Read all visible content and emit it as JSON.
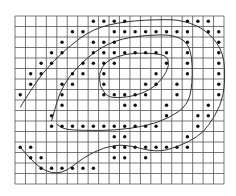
{
  "figure": {
    "grid": {
      "cols": 20,
      "rows": 16,
      "x0": 15,
      "y0": 16,
      "cell_w": 10.45,
      "cell_h": 10.5,
      "line_color": "#555555"
    },
    "dot_color": "#111111",
    "curve_color": "#333333",
    "dots": [
      [
        7,
        0
      ],
      [
        8,
        0
      ],
      [
        9,
        0
      ],
      [
        10,
        0
      ],
      [
        16,
        0
      ],
      [
        17,
        0
      ],
      [
        18,
        0
      ],
      [
        5,
        1
      ],
      [
        6,
        1
      ],
      [
        9,
        1
      ],
      [
        10,
        1
      ],
      [
        11,
        1
      ],
      [
        12,
        1
      ],
      [
        13,
        1
      ],
      [
        14,
        1
      ],
      [
        15,
        1
      ],
      [
        16,
        1
      ],
      [
        18,
        1
      ],
      [
        19,
        1
      ],
      [
        4,
        2
      ],
      [
        7,
        2
      ],
      [
        8,
        2
      ],
      [
        9,
        2
      ],
      [
        16,
        2
      ],
      [
        19,
        2
      ],
      [
        3,
        3
      ],
      [
        4,
        3
      ],
      [
        7,
        3
      ],
      [
        8,
        3
      ],
      [
        9,
        3
      ],
      [
        10,
        3
      ],
      [
        11,
        3
      ],
      [
        12,
        3
      ],
      [
        13,
        3
      ],
      [
        14,
        3
      ],
      [
        16,
        3
      ],
      [
        19,
        3
      ],
      [
        2,
        4
      ],
      [
        3,
        4
      ],
      [
        6,
        4
      ],
      [
        7,
        4
      ],
      [
        8,
        4
      ],
      [
        9,
        4
      ],
      [
        14,
        4
      ],
      [
        16,
        4
      ],
      [
        19,
        4
      ],
      [
        1,
        5
      ],
      [
        2,
        5
      ],
      [
        5,
        5
      ],
      [
        6,
        5
      ],
      [
        8,
        5
      ],
      [
        13,
        5
      ],
      [
        16,
        5
      ],
      [
        19,
        5
      ],
      [
        1,
        6
      ],
      [
        4,
        6
      ],
      [
        5,
        6
      ],
      [
        8,
        6
      ],
      [
        12,
        6
      ],
      [
        13,
        6
      ],
      [
        15,
        6
      ],
      [
        19,
        6
      ],
      [
        0,
        7
      ],
      [
        4,
        7
      ],
      [
        8,
        7
      ],
      [
        9,
        7
      ],
      [
        10,
        7
      ],
      [
        11,
        7
      ],
      [
        12,
        7
      ],
      [
        15,
        7
      ],
      [
        19,
        7
      ],
      [
        4,
        8
      ],
      [
        10,
        8
      ],
      [
        11,
        8
      ],
      [
        14,
        8
      ],
      [
        18,
        8
      ],
      [
        3,
        9
      ],
      [
        14,
        9
      ],
      [
        17,
        9
      ],
      [
        18,
        9
      ],
      [
        3,
        10
      ],
      [
        4,
        10
      ],
      [
        5,
        10
      ],
      [
        6,
        10
      ],
      [
        7,
        10
      ],
      [
        8,
        10
      ],
      [
        9,
        10
      ],
      [
        10,
        10
      ],
      [
        11,
        10
      ],
      [
        12,
        10
      ],
      [
        13,
        10
      ],
      [
        17,
        10
      ],
      [
        9,
        11
      ],
      [
        10,
        11
      ],
      [
        16,
        11
      ],
      [
        0,
        12
      ],
      [
        1,
        12
      ],
      [
        9,
        12
      ],
      [
        10,
        12
      ],
      [
        11,
        12
      ],
      [
        12,
        12
      ],
      [
        13,
        12
      ],
      [
        14,
        12
      ],
      [
        15,
        12
      ],
      [
        16,
        12
      ],
      [
        1,
        13
      ],
      [
        2,
        13
      ],
      [
        9,
        13
      ],
      [
        10,
        13
      ],
      [
        12,
        13
      ],
      [
        2,
        14
      ],
      [
        3,
        14
      ],
      [
        4,
        14
      ],
      [
        5,
        14
      ],
      [
        6,
        14
      ],
      [
        7,
        14
      ]
    ],
    "curves": [
      {
        "name": "outer-curve",
        "points": [
          [
            0,
            8.2
          ],
          [
            2,
            5
          ],
          [
            4.5,
            2.5
          ],
          [
            7,
            0.7
          ],
          [
            10,
            0
          ],
          [
            14,
            -0.2
          ],
          [
            16,
            0
          ],
          [
            18,
            1
          ],
          [
            19.5,
            3
          ],
          [
            19.6,
            6
          ],
          [
            19.2,
            8
          ],
          [
            18,
            10
          ],
          [
            17,
            11
          ],
          [
            15,
            12
          ],
          [
            13,
            12.5
          ],
          [
            10,
            11.7
          ],
          [
            8,
            12
          ],
          [
            6,
            13
          ],
          [
            4,
            14.6
          ],
          [
            2,
            14.2
          ],
          [
            0,
            12
          ]
        ]
      },
      {
        "name": "middle-curve",
        "points": [
          [
            3,
            9.5
          ],
          [
            4,
            6
          ],
          [
            6.5,
            3.3
          ],
          [
            9,
            1.8
          ],
          [
            12,
            1.3
          ],
          [
            15,
            1.3
          ],
          [
            16.4,
            2.5
          ],
          [
            16.5,
            6
          ],
          [
            16,
            8
          ],
          [
            14.3,
            9.2
          ],
          [
            12,
            10
          ],
          [
            9,
            10.4
          ],
          [
            6,
            10.4
          ],
          [
            4.2,
            10.3
          ],
          [
            3.5,
            9.8
          ]
        ]
      },
      {
        "name": "inner-curve",
        "points": [
          [
            7.7,
            6.2
          ],
          [
            7.5,
            5
          ],
          [
            8.2,
            3.8
          ],
          [
            10,
            3.1
          ],
          [
            12,
            3
          ],
          [
            14,
            3.2
          ],
          [
            14.3,
            4.2
          ],
          [
            13.6,
            5.5
          ],
          [
            12.5,
            6.5
          ],
          [
            11,
            7.1
          ],
          [
            9.5,
            7.3
          ],
          [
            8.3,
            7.2
          ],
          [
            7.7,
            6.2
          ]
        ]
      }
    ]
  }
}
